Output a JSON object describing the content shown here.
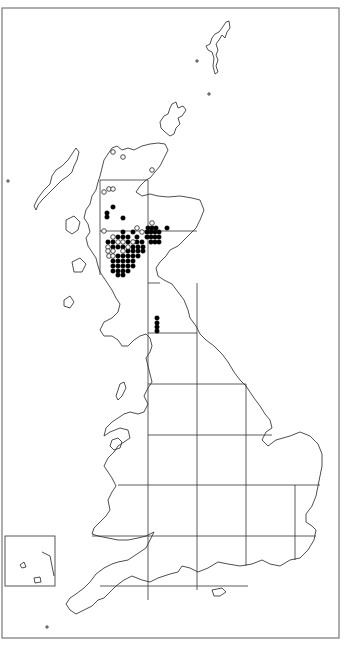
{
  "map": {
    "title": "",
    "region": "Great Britain distribution map",
    "colors": {
      "background": "#ffffff",
      "coastline": "#222222",
      "grid": "#333333",
      "frame": "#777777",
      "filled_dot": "#000000",
      "open_dot": "#ffffff"
    },
    "frame": {
      "x": 2,
      "y": 8,
      "width": 337,
      "height": 630
    },
    "inset_box": {
      "x": 5,
      "y": 536,
      "width": 50,
      "height": 50,
      "label": "Channel Islands inset"
    },
    "grid": {
      "vertical_x": [
        100,
        148,
        197,
        246,
        295
      ],
      "horizontal_y": [
        180,
        231,
        283,
        333,
        384,
        435,
        485,
        536,
        586
      ]
    },
    "legend": {
      "filled": "Recorded (recent)",
      "open": "Recorded (older)"
    }
  },
  "chart_data": {
    "type": "scatter",
    "title": "",
    "xlabel": "",
    "ylabel": "",
    "grid": true,
    "series": [
      {
        "name": "filled",
        "points": [
          [
            113,
            207
          ],
          [
            107,
            213
          ],
          [
            107,
            217
          ],
          [
            123,
            218
          ],
          [
            148,
            228
          ],
          [
            152,
            228
          ],
          [
            156,
            228
          ],
          [
            167,
            228
          ],
          [
            123,
            232
          ],
          [
            133,
            232
          ],
          [
            147,
            232
          ],
          [
            151,
            232
          ],
          [
            155,
            232
          ],
          [
            159,
            232
          ],
          [
            118,
            237
          ],
          [
            123,
            237
          ],
          [
            128,
            237
          ],
          [
            137,
            237
          ],
          [
            147,
            237
          ],
          [
            151,
            237
          ],
          [
            155,
            237
          ],
          [
            159,
            237
          ],
          [
            108,
            242
          ],
          [
            113,
            242
          ],
          [
            128,
            242
          ],
          [
            137,
            242
          ],
          [
            142,
            242
          ],
          [
            151,
            242
          ],
          [
            155,
            242
          ],
          [
            159,
            242
          ],
          [
            113,
            247
          ],
          [
            118,
            247
          ],
          [
            123,
            247
          ],
          [
            133,
            247
          ],
          [
            138,
            247
          ],
          [
            143,
            247
          ],
          [
            128,
            251
          ],
          [
            133,
            251
          ],
          [
            138,
            251
          ],
          [
            143,
            251
          ],
          [
            118,
            256
          ],
          [
            123,
            256
          ],
          [
            128,
            256
          ],
          [
            133,
            256
          ],
          [
            138,
            256
          ],
          [
            113,
            261
          ],
          [
            118,
            261
          ],
          [
            123,
            261
          ],
          [
            128,
            261
          ],
          [
            133,
            261
          ],
          [
            113,
            266
          ],
          [
            118,
            266
          ],
          [
            123,
            266
          ],
          [
            128,
            266
          ],
          [
            133,
            266
          ],
          [
            113,
            271
          ],
          [
            118,
            271
          ],
          [
            123,
            271
          ],
          [
            128,
            271
          ],
          [
            118,
            275
          ],
          [
            123,
            275
          ],
          [
            157,
            318
          ],
          [
            157,
            323
          ],
          [
            157,
            327
          ],
          [
            157,
            331
          ]
        ]
      },
      {
        "name": "open",
        "points": [
          [
            113,
            152
          ],
          [
            123,
            157
          ],
          [
            152,
            170
          ],
          [
            104,
            192
          ],
          [
            109,
            189
          ],
          [
            113,
            189
          ],
          [
            137,
            228
          ],
          [
            152,
            223
          ],
          [
            104,
            231
          ],
          [
            113,
            237
          ],
          [
            142,
            232
          ],
          [
            118,
            242
          ],
          [
            123,
            242
          ],
          [
            133,
            242
          ],
          [
            108,
            247
          ],
          [
            128,
            247
          ],
          [
            108,
            251
          ],
          [
            113,
            251
          ],
          [
            123,
            251
          ],
          [
            109,
            256
          ],
          [
            113,
            256
          ]
        ]
      }
    ]
  }
}
